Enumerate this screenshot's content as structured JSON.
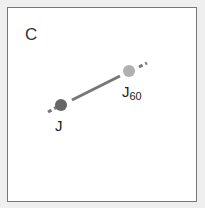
{
  "panel": {
    "label": "C"
  },
  "points": {
    "start": {
      "label": "J",
      "color": "#666666"
    },
    "end": {
      "label": "J",
      "subscript": "60",
      "color": "#b0b0b0"
    }
  },
  "line": {
    "color": "#777777"
  }
}
